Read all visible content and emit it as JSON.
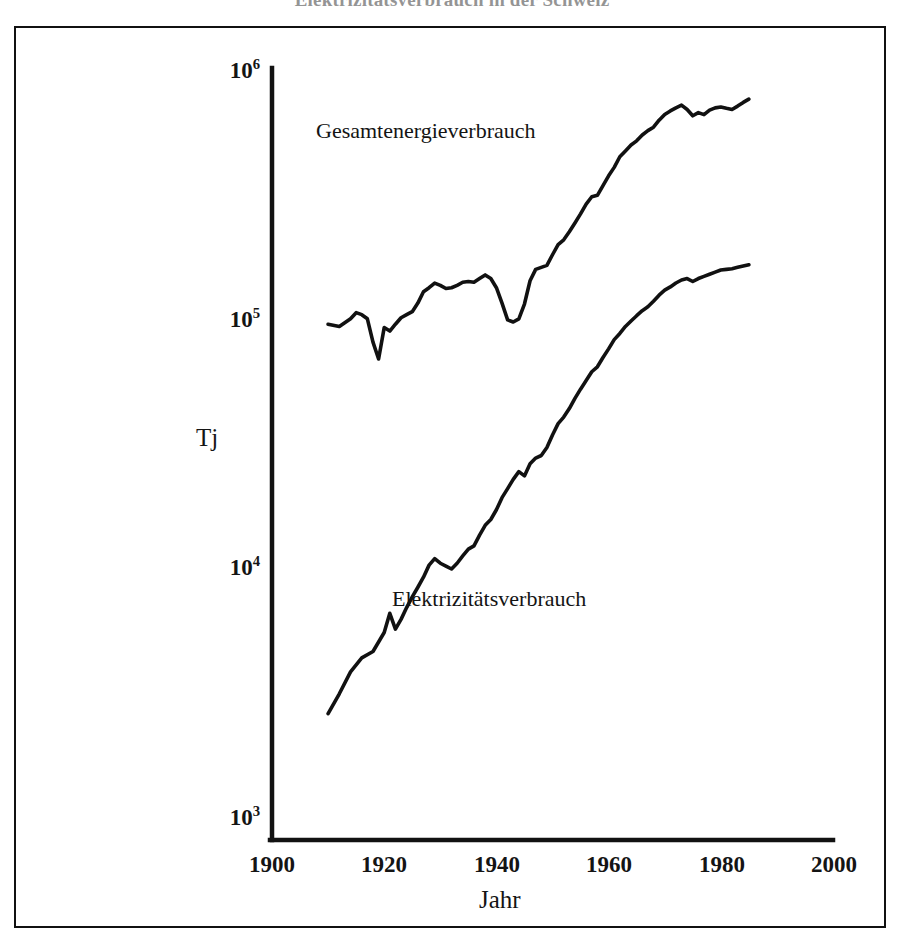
{
  "figure": {
    "title": "Elektrizitätsverbrauch in der Schweiz",
    "frame_color": "#111111",
    "background": "#ffffff"
  },
  "chart_data": {
    "type": "line",
    "title": "Elektrizitätsverbrauch in der Schweiz",
    "xlabel": "Jahr",
    "ylabel": "Tj",
    "yscale": "log",
    "xlim": [
      1900,
      2000
    ],
    "ylim": [
      1000,
      1000000
    ],
    "grid": false,
    "legend_position": "inline-annotations",
    "x_ticks": [
      "1900",
      "1920",
      "1940",
      "1960",
      "1980",
      "2000"
    ],
    "x_tick_values": [
      1900,
      1920,
      1940,
      1960,
      1980,
      2000
    ],
    "y_ticks": [
      "10^3",
      "10^4",
      "10^5",
      "10^6"
    ],
    "y_tick_values": [
      1000,
      10000,
      100000,
      1000000
    ],
    "y_tick_labels": [
      {
        "base": "10",
        "exp": "3"
      },
      {
        "base": "10",
        "exp": "4"
      },
      {
        "base": "10",
        "exp": "5"
      },
      {
        "base": "10",
        "exp": "6"
      }
    ],
    "series": [
      {
        "name": "Gesamtenergieverbrauch",
        "label": "Gesamtenergieverbrauch",
        "color": "#111111",
        "x": [
          1910,
          1912,
          1914,
          1915,
          1916,
          1917,
          1918,
          1919,
          1920,
          1921,
          1922,
          1923,
          1924,
          1925,
          1926,
          1927,
          1928,
          1929,
          1930,
          1931,
          1932,
          1933,
          1934,
          1935,
          1936,
          1937,
          1938,
          1939,
          1940,
          1941,
          1942,
          1943,
          1944,
          1945,
          1946,
          1947,
          1948,
          1949,
          1950,
          1951,
          1952,
          1953,
          1954,
          1955,
          1956,
          1957,
          1958,
          1959,
          1960,
          1961,
          1962,
          1963,
          1964,
          1965,
          1966,
          1967,
          1968,
          1969,
          1970,
          1971,
          1972,
          1973,
          1974,
          1975,
          1976,
          1977,
          1978,
          1979,
          1980,
          1981,
          1982,
          1983,
          1984,
          1985
        ],
        "y": [
          101000,
          99000,
          106000,
          112000,
          110000,
          106000,
          86000,
          74000,
          98000,
          95000,
          101000,
          107000,
          110000,
          113000,
          122000,
          135000,
          140000,
          146000,
          143000,
          139000,
          140000,
          143000,
          147000,
          148000,
          147000,
          152000,
          157000,
          152000,
          140000,
          122000,
          105000,
          103000,
          106000,
          121000,
          149000,
          165000,
          168000,
          171000,
          188000,
          206000,
          215000,
          231000,
          250000,
          271000,
          296000,
          316000,
          320000,
          349000,
          381000,
          411000,
          452000,
          476000,
          502000,
          521000,
          549000,
          571000,
          589000,
          627000,
          660000,
          681000,
          700000,
          717000,
          690000,
          652000,
          671000,
          659000,
          686000,
          700000,
          705000,
          697000,
          690000,
          711000,
          735000,
          757000
        ]
      },
      {
        "name": "Elektrizitätsverbrauch",
        "label": "Elektrizitätsverbrauch",
        "color": "#111111",
        "x": [
          1910,
          1912,
          1914,
          1916,
          1918,
          1920,
          1921,
          1922,
          1923,
          1924,
          1925,
          1926,
          1927,
          1928,
          1929,
          1930,
          1931,
          1932,
          1933,
          1934,
          1935,
          1936,
          1937,
          1938,
          1939,
          1940,
          1941,
          1942,
          1943,
          1944,
          1945,
          1946,
          1947,
          1948,
          1949,
          1950,
          1951,
          1952,
          1953,
          1954,
          1955,
          1956,
          1957,
          1958,
          1959,
          1960,
          1961,
          1962,
          1963,
          1964,
          1965,
          1966,
          1967,
          1968,
          1969,
          1970,
          1971,
          1972,
          1973,
          1974,
          1975,
          1976,
          1977,
          1978,
          1979,
          1980,
          1981,
          1982,
          1983,
          1984,
          1985
        ],
        "y": [
          3100,
          3700,
          4500,
          5100,
          5400,
          6400,
          7600,
          6600,
          7200,
          8000,
          8800,
          9600,
          10500,
          11700,
          12400,
          11900,
          11600,
          11300,
          11900,
          12700,
          13500,
          13900,
          15300,
          16700,
          17600,
          19200,
          21400,
          23200,
          25200,
          27000,
          26000,
          29000,
          30500,
          31200,
          33500,
          37500,
          41500,
          44000,
          47500,
          52000,
          56500,
          61000,
          66000,
          69000,
          75000,
          81000,
          88000,
          93000,
          99000,
          104000,
          109000,
          114000,
          118000,
          124000,
          131000,
          137000,
          141000,
          146000,
          150000,
          152000,
          148000,
          152000,
          155000,
          158000,
          161000,
          164000,
          165000,
          166000,
          168000,
          170000,
          172000
        ]
      }
    ],
    "annotations": [
      {
        "text": "Gesamtenergieverbrauch",
        "x_px": 316,
        "y_px": 130
      },
      {
        "text": "Elektrizitätsverbrauch",
        "x_px": 392,
        "y_px": 597
      }
    ]
  },
  "axes": {
    "y_axis_title": "Tj",
    "x_axis_title": "Jahr"
  }
}
